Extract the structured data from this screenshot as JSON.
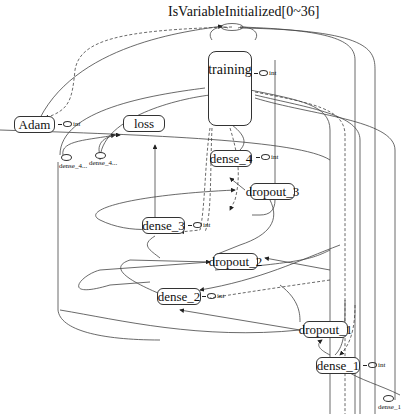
{
  "title": "IsVariableInitialized[0~36]",
  "nodes": {
    "training": "training",
    "adam": "Adam",
    "loss": "loss",
    "dense_4": "dense_4",
    "dropout_3": "dropout_3",
    "dense_3": "dense_3",
    "dropout_2": "dropout_2",
    "dense_2": "dense_2",
    "dropout_1": "dropout_1",
    "dense_1": "dense_1"
  },
  "badges": {
    "int": "int",
    "title_count": "37"
  },
  "aux_nodes": {
    "dense_4_a": "dense_4...",
    "dense_4_b": "dense_4...",
    "dense_1": "dense_1"
  },
  "colors": {
    "stroke": "#333333",
    "background": "#ffffff"
  }
}
